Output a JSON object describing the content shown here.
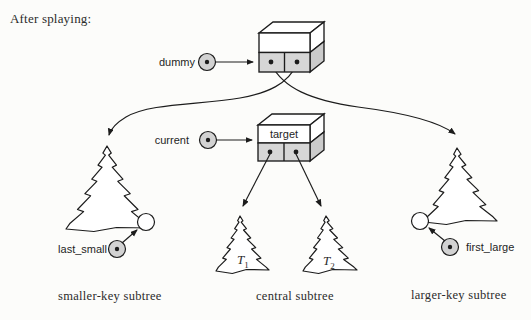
{
  "title": "After splaying:",
  "nodes": {
    "dummy": {
      "label": "dummy"
    },
    "current": {
      "label": "current"
    },
    "target": {
      "label": "target"
    },
    "last_small": {
      "label": "last_small"
    },
    "first_large": {
      "label": "first_large"
    }
  },
  "subtrees": {
    "t1": {
      "base": "T",
      "sub": "1"
    },
    "t2": {
      "base": "T",
      "sub": "2"
    },
    "smaller_caption": "smaller-key subtree",
    "central_caption": "central subtree",
    "larger_caption": "larger-key subtree"
  },
  "colors": {
    "line": "#1c1c1c",
    "cell_gray": "#d6d6d6",
    "side_gray": "#cbcbcb",
    "handle_gray": "#d2d2d2",
    "background": "#fcfcfa",
    "text": "#222222"
  }
}
